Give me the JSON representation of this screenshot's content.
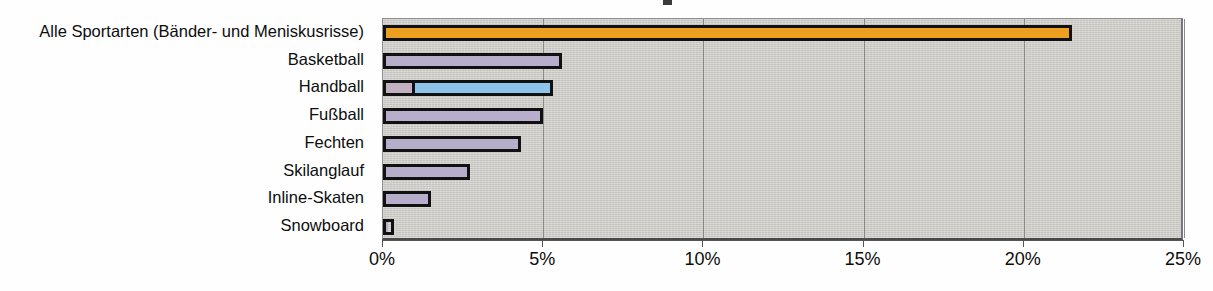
{
  "chart_data": {
    "type": "bar",
    "orientation": "horizontal",
    "title": "",
    "xlabel": "",
    "ylabel": "",
    "xlim": [
      0,
      25
    ],
    "xtick_labels": [
      "0%",
      "5%",
      "10%",
      "15%",
      "20%",
      "25%"
    ],
    "xticks": [
      0,
      5,
      10,
      15,
      20,
      25
    ],
    "grid": "vertical",
    "legend": "none",
    "categories": [
      "Alle Sportarten (Bänder- und Meniskusrisse)",
      "Basketball",
      "Handball",
      "Fußball",
      "Fechten",
      "Skilanglauf",
      "Inline-Skaten",
      "Snowboard"
    ],
    "values": [
      21.5,
      5.6,
      5.3,
      5.0,
      4.3,
      2.7,
      1.5,
      0.35
    ],
    "bars": [
      {
        "category": "Alle Sportarten (Bänder- und Meniskusrisse)",
        "value": 21.5,
        "segments": [
          {
            "value": 21.5,
            "color": "#eda01f"
          }
        ]
      },
      {
        "category": "Basketball",
        "value": 5.6,
        "segments": [
          {
            "value": 5.6,
            "color": "#b6aecb"
          }
        ]
      },
      {
        "category": "Handball",
        "value": 5.3,
        "segments": [
          {
            "value": 0.85,
            "color": "#c2afc2"
          },
          {
            "value": 4.45,
            "color": "#8ec4ea"
          }
        ]
      },
      {
        "category": "Fußball",
        "value": 5.0,
        "segments": [
          {
            "value": 5.0,
            "color": "#b6aecb"
          }
        ]
      },
      {
        "category": "Fechten",
        "value": 4.3,
        "segments": [
          {
            "value": 4.3,
            "color": "#b6aecb"
          }
        ]
      },
      {
        "category": "Skilanglauf",
        "value": 2.7,
        "segments": [
          {
            "value": 2.7,
            "color": "#b6aecb"
          }
        ]
      },
      {
        "category": "Inline-Skaten",
        "value": 1.5,
        "segments": [
          {
            "value": 1.5,
            "color": "#b6aecb"
          }
        ]
      },
      {
        "category": "Snowboard",
        "value": 0.35,
        "segments": [
          {
            "value": 0.35,
            "color": "#b6aecb"
          }
        ]
      }
    ],
    "colors": {
      "plot_background": "#cfcdc8",
      "bar_outline": "#111111",
      "accent_orange": "#eda01f",
      "bar_lavender": "#b6aecb",
      "bar_blue": "#8ec4ea",
      "gridline": "#8a8a88"
    }
  }
}
